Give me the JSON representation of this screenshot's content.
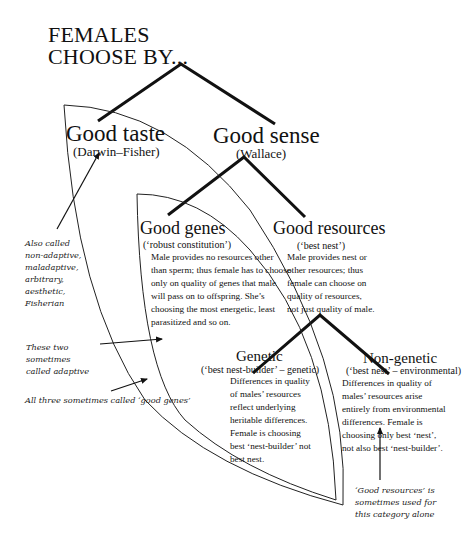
{
  "title": {
    "line1": "FEMALES",
    "line2": "CHOOSE BY..."
  },
  "nodes": {
    "good_taste": {
      "label": "Good taste",
      "sub": "(Darwin–Fisher)"
    },
    "good_sense": {
      "label": "Good sense",
      "sub": "(Wallace)"
    },
    "good_genes": {
      "label": "Good genes",
      "sub": "(‘robust constitution’)",
      "desc": "Male provides no resources other than sperm; thus female has to choose only on quality of genes that male will pass on to offspring. She’s choosing the most energetic, least parasitized and so on."
    },
    "good_resources": {
      "label": "Good resources",
      "sub": "(‘best nest’)",
      "desc": "Male provides nest or other resources; thus female can choose on quality of resources, not just quality of male."
    },
    "genetic": {
      "label": "Genetic",
      "sub": "(‘best nest-builder’ – genetic)",
      "desc": "Differences in quality of males’ resources reflect underlying heritable differences. Female is choosing best ‘nest-builder’ not best nest."
    },
    "non_genetic": {
      "label": "Non-genetic",
      "sub": "(‘best nest’ – environmental)",
      "desc": "Differences in quality of males’ resources arise entirely from environmental differences. Female is choosing only best ‘nest’, not also best ‘nest-builder’."
    }
  },
  "annotations": {
    "also_called": "Also called non-adaptive, maladaptive, arbitrary, aesthetic, Fisherian",
    "these_two": "These two sometimes called adaptive",
    "all_three": "All three sometimes called ‘good genes’",
    "good_resources_note": "‘Good resources’ is sometimes used for this category alone"
  }
}
